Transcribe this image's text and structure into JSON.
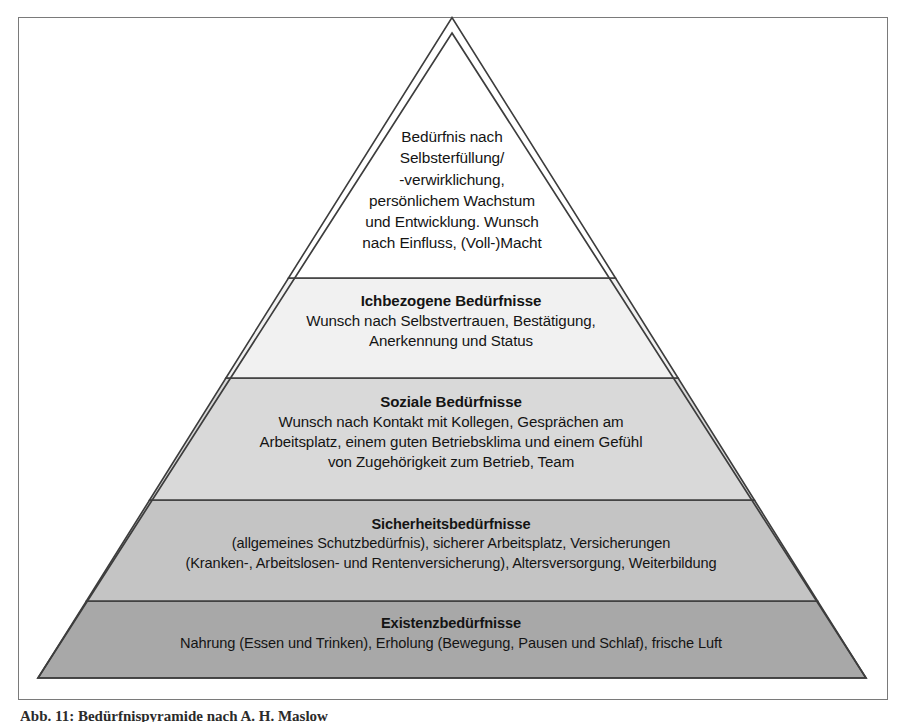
{
  "figure": {
    "caption": "Abb. 11: Bedürfnispyramide nach A. H. Maslow",
    "frame_color": "#7a7a7a",
    "background": "#ffffff"
  },
  "pyramid": {
    "apex": {
      "x": 452,
      "y": 33
    },
    "base_left": {
      "x": 38,
      "y": 678
    },
    "base_right": {
      "x": 866,
      "y": 678
    },
    "outline_color": "#3d3d3d",
    "tiers": [
      {
        "level": 5,
        "name": "selbstverwirklichung",
        "fill": "#ffffff",
        "divider_y": 278,
        "title": "",
        "lines": [
          "Bedürfnis nach",
          "Selbsterfüllung/",
          "-verwirklichung,",
          "persönlichem Wachstum",
          "und Entwicklung. Wunsch",
          "nach Einfluss, (Voll-)Macht"
        ]
      },
      {
        "level": 4,
        "name": "ichbezogene-beduerfnisse",
        "fill": "#f1f1f1",
        "divider_y": 378,
        "title": "Ichbezogene Bedürfnisse",
        "lines": [
          "Wunsch nach Selbstvertrauen, Bestätigung,",
          "Anerkennung und Status"
        ]
      },
      {
        "level": 3,
        "name": "soziale-beduerfnisse",
        "fill": "#d9d9d9",
        "divider_y": 500,
        "title": "Soziale Bedürfnisse",
        "lines": [
          "Wunsch nach Kontakt mit Kollegen, Gesprächen am",
          "Arbeitsplatz, einem guten Betriebsklima und einem Gefühl",
          "von Zugehörigkeit zum Betrieb, Team"
        ]
      },
      {
        "level": 2,
        "name": "sicherheitsbeduerfnisse",
        "fill": "#c4c4c4",
        "divider_y": 601,
        "title": "Sicherheitsbedürfnisse",
        "lines": [
          "(allgemeines Schutzbedürfnis), sicherer Arbeitsplatz, Versicherungen",
          "(Kranken-, Arbeitslosen- und Rentenversicherung), Altersversorgung, Weiterbildung"
        ]
      },
      {
        "level": 1,
        "name": "existenzbeduerfnisse",
        "fill": "#a8a8a8",
        "divider_y": 678,
        "title": "Existenzbedürfnisse",
        "lines": [
          "Nahrung (Essen und Trinken), Erholung (Bewegung, Pausen und Schlaf), frische Luft"
        ]
      }
    ]
  }
}
